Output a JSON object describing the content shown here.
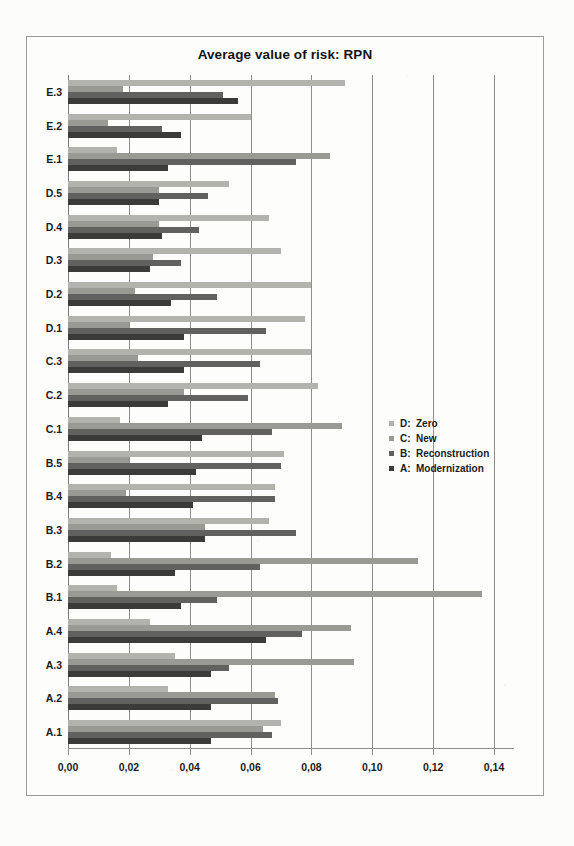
{
  "figure": {
    "title": "Average value of risk: RPN"
  },
  "legend": {
    "position": "middle-right",
    "items": [
      {
        "key": "D:",
        "name": "Zero",
        "color": "#b3b3ae",
        "icon": "square-swatch-icon"
      },
      {
        "key": "C:",
        "name": "New",
        "color": "#9a9a95",
        "icon": "square-swatch-icon"
      },
      {
        "key": "B:",
        "name": "Reconstruction",
        "color": "#616160",
        "icon": "square-swatch-icon"
      },
      {
        "key": "A:",
        "name": "Modernization",
        "color": "#3b3b3a",
        "icon": "square-swatch-icon"
      }
    ]
  },
  "axis": {
    "x_ticks": [
      "0,00",
      "0,02",
      "0,04",
      "0,06",
      "0,08",
      "0,10",
      "0,12",
      "0,14"
    ],
    "x_tick_values": [
      0.0,
      0.02,
      0.04,
      0.06,
      0.08,
      0.1,
      0.12,
      0.14
    ]
  },
  "chart_data": {
    "type": "bar",
    "orientation": "horizontal",
    "title": "Average value of risk: RPN",
    "xlabel": "",
    "ylabel": "",
    "xlim": [
      0.0,
      0.14
    ],
    "grid": true,
    "legend_position": "middle-right",
    "decimal_separator": ",",
    "categories": [
      "E.3",
      "E.2",
      "E.1",
      "D.5",
      "D.4",
      "D.3",
      "D.2",
      "D.1",
      "C.3",
      "C.2",
      "C.1",
      "B.5",
      "B.4",
      "B.3",
      "B.2",
      "B.1",
      "A.4",
      "A.3",
      "A.2",
      "A.1"
    ],
    "series": [
      {
        "name": "D: Zero",
        "key": "D",
        "label": "Zero",
        "color": "#b3b3ae",
        "values": [
          0.091,
          0.06,
          0.016,
          0.053,
          0.066,
          0.07,
          0.08,
          0.078,
          0.08,
          0.082,
          0.017,
          0.071,
          0.068,
          0.066,
          0.014,
          0.016,
          0.027,
          0.035,
          0.033,
          0.07
        ]
      },
      {
        "name": "C: New",
        "key": "C",
        "label": "New",
        "color": "#9a9a95",
        "values": [
          0.018,
          0.013,
          0.086,
          0.03,
          0.03,
          0.028,
          0.022,
          0.02,
          0.023,
          0.038,
          0.09,
          0.02,
          0.019,
          0.045,
          0.115,
          0.136,
          0.093,
          0.094,
          0.068,
          0.064
        ]
      },
      {
        "name": "B: Reconstruction",
        "key": "B",
        "label": "Reconstruction",
        "color": "#616160",
        "values": [
          0.051,
          0.031,
          0.075,
          0.046,
          0.043,
          0.037,
          0.049,
          0.065,
          0.063,
          0.059,
          0.067,
          0.07,
          0.068,
          0.075,
          0.063,
          0.049,
          0.077,
          0.053,
          0.069,
          0.067
        ]
      },
      {
        "name": "A: Modernization",
        "key": "A",
        "label": "Modernization",
        "color": "#3b3b3a",
        "values": [
          0.056,
          0.037,
          0.033,
          0.03,
          0.031,
          0.027,
          0.034,
          0.038,
          0.038,
          0.033,
          0.044,
          0.042,
          0.041,
          0.045,
          0.035,
          0.037,
          0.065,
          0.047,
          0.047,
          0.047
        ]
      }
    ]
  }
}
